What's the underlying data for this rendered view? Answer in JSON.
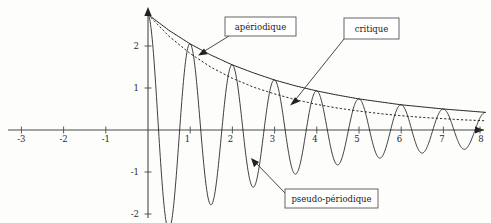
{
  "chart_data": {
    "type": "line",
    "title": "",
    "xlabel": "",
    "ylabel": "",
    "xlim": [
      -3.45,
      8.35
    ],
    "ylim": [
      -2.45,
      3.05
    ],
    "grid": false,
    "legend_position": "callout-boxes",
    "x_ticks": [
      -3,
      -2,
      -1,
      1,
      2,
      3,
      4,
      5,
      6,
      7,
      8
    ],
    "y_ticks": [
      2,
      1,
      -1,
      -2
    ],
    "x_tick_labels": [
      "-3",
      "-2",
      "-1",
      "1",
      "2",
      "3",
      "4",
      "5",
      "6",
      "7",
      "8"
    ],
    "y_tick_labels": [
      "2",
      "1",
      "-1",
      "-2"
    ],
    "annotations": [
      {
        "id": "aperiodique",
        "label": "apériodique",
        "points_to_series": "apériodique",
        "box_x": 225,
        "box_y": 17,
        "box_w": 71,
        "box_h": 19,
        "target_x": 198,
        "target_y": 54
      },
      {
        "id": "critique",
        "label": "critique",
        "points_to_series": "critique",
        "box_x": 344,
        "box_y": 18,
        "box_w": 55,
        "box_h": 21,
        "target_x": 290,
        "target_y": 103
      },
      {
        "id": "pseudo-periodique",
        "label": "pseudo-périodique",
        "points_to_series": "pseudo-périodique",
        "box_x": 285,
        "box_y": 189,
        "box_w": 93,
        "box_h": 19,
        "target_x": 251,
        "target_y": 159
      }
    ],
    "series": [
      {
        "name": "apériodique",
        "style": "solid",
        "description": "Overdamped envelope, monotonic decay from 2.75 toward 0",
        "x": [
          0,
          0.5,
          1,
          1.5,
          2,
          2.5,
          3,
          3.5,
          4,
          4.5,
          5,
          5.5,
          6,
          6.5,
          7,
          7.5,
          8
        ],
        "values": [
          2.75,
          2.37,
          2.05,
          1.78,
          1.55,
          1.36,
          1.19,
          1.05,
          0.93,
          0.83,
          0.74,
          0.67,
          0.6,
          0.55,
          0.5,
          0.46,
          0.42
        ]
      },
      {
        "name": "critique",
        "style": "dashed",
        "description": "Critically damped response decaying faster than the overdamped case",
        "x": [
          0,
          0.5,
          1,
          1.5,
          2,
          2.5,
          3,
          3.5,
          4,
          4.5,
          5,
          5.5,
          6,
          6.5,
          7,
          7.5,
          8
        ],
        "values": [
          2.75,
          2.23,
          1.82,
          1.49,
          1.23,
          1.02,
          0.86,
          0.72,
          0.61,
          0.52,
          0.45,
          0.39,
          0.34,
          0.3,
          0.27,
          0.24,
          0.22
        ]
      },
      {
        "name": "pseudo-périodique",
        "style": "solid-oscillating",
        "description": "Underdamped oscillation of period 1, amplitude decaying with the apériodique envelope, peaks touching the envelope",
        "amplitude_envelope": "apériodique",
        "period": 1.0,
        "x": [
          0,
          0.25,
          0.5,
          0.75,
          1,
          1.25,
          1.5,
          1.75,
          2,
          2.25,
          2.5,
          2.75,
          3,
          3.25,
          3.5,
          3.75,
          4,
          4.25,
          4.5,
          4.75,
          5,
          5.25,
          5.5,
          5.75,
          6,
          6.25,
          6.5,
          6.75,
          7,
          7.25,
          7.5,
          7.75,
          8
        ],
        "values": [
          2.75,
          0.0,
          -2.37,
          0.0,
          2.05,
          0.0,
          -1.78,
          0.0,
          1.55,
          0.0,
          -1.36,
          0.0,
          1.19,
          0.0,
          -1.05,
          0.0,
          0.93,
          0.0,
          -0.83,
          0.0,
          0.74,
          0.0,
          -0.67,
          0.0,
          0.6,
          0.0,
          -0.55,
          0.0,
          0.5,
          0.0,
          -0.46,
          0.0,
          0.42
        ]
      }
    ]
  },
  "axes": {
    "x_axis_name": "time-axis",
    "y_axis_name": "amplitude-axis",
    "origin_px": {
      "x": 148,
      "y": 130
    },
    "unit_px": {
      "x": 42.2,
      "y": 42.0
    }
  }
}
